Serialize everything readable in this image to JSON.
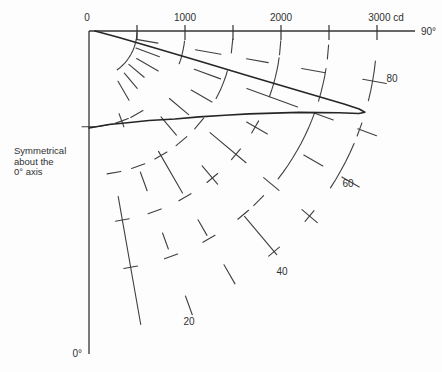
{
  "diagram": {
    "kind": "polar luminous intensity distribution",
    "background": "#fdfdfd",
    "grid_color": "#3f3f3f",
    "axis_color": "#343434",
    "curve_color": "#262626",
    "text_color": "#303030"
  },
  "annotation": {
    "lines": [
      "Symmetrical",
      "about the",
      "0° axis"
    ]
  },
  "cd_axis": {
    "labels": [
      {
        "text": "0",
        "cd": 0,
        "dx": -2
      },
      {
        "text": "1000",
        "cd": 1000,
        "dx": 0
      },
      {
        "text": "2000",
        "cd": 2000,
        "dx": 0
      },
      {
        "text": "3000 cd",
        "cd": 3000,
        "dx": 9
      }
    ],
    "tick_cds": [
      500,
      1000,
      1500,
      2000,
      2500,
      3000
    ],
    "end_label": "90°"
  },
  "nadir_axis": {
    "label": "0°"
  },
  "angle_ring_labels": [
    {
      "text": "80",
      "x": 392,
      "y": 82
    },
    {
      "text": "60",
      "x": 348,
      "y": 187
    },
    {
      "text": "40",
      "x": 282,
      "y": 275
    },
    {
      "text": "20",
      "x": 189,
      "y": 325
    }
  ],
  "chart_data": {
    "type": "line",
    "coordinate_system": "polar",
    "title": "",
    "value_unit": "cd",
    "angle_unit": "degrees from 0° (nadir) axis",
    "cd_range": [
      0,
      3000
    ],
    "angle_deg_range": [
      0,
      90
    ],
    "origin_px": [
      89,
      31
    ],
    "px_per_cd": 0.096,
    "axis_end_x_px": 415,
    "nadir_end_y_px": 354,
    "ray_angles_deg": [
      10,
      20,
      30,
      40,
      50,
      60,
      70,
      80
    ],
    "arc_radii_cd": [
      500,
      1000,
      1500,
      2000,
      2500,
      3000
    ],
    "curve_points": [
      {
        "angle_deg": 90.0,
        "cd": 62
      },
      {
        "angle_deg": 78.0,
        "cd": 320
      },
      {
        "angle_deg": 75.7,
        "cd": 645
      },
      {
        "angle_deg": 74.7,
        "cd": 1188
      },
      {
        "angle_deg": 74.3,
        "cd": 1730
      },
      {
        "angle_deg": 74.1,
        "cd": 2273
      },
      {
        "angle_deg": 74.0,
        "cd": 2763
      },
      {
        "angle_deg": 73.9,
        "cd": 2930
      },
      {
        "angle_deg": 73.6,
        "cd": 2996
      },
      {
        "angle_deg": 73.0,
        "cd": 2940
      },
      {
        "angle_deg": 71.9,
        "cd": 2738
      },
      {
        "angle_deg": 68.8,
        "cd": 2346
      },
      {
        "angle_deg": 62.6,
        "cd": 1877
      },
      {
        "angle_deg": 58.2,
        "cd": 1667
      },
      {
        "angle_deg": 52.0,
        "cd": 1454
      },
      {
        "angle_deg": 44.3,
        "cd": 1281
      },
      {
        "angle_deg": 33.8,
        "cd": 1122
      },
      {
        "angle_deg": 21.4,
        "cd": 1029
      },
      {
        "angle_deg": 12.1,
        "cd": 996
      },
      {
        "angle_deg": 0.0,
        "cd": 1010
      }
    ],
    "grid_style": {
      "ray_dash_segments_px": {
        "10": [
          [
            168,
            298
          ]
        ],
        "20": [
          [
            88,
            102
          ],
          [
            150,
            170
          ],
          [
            215,
            232
          ],
          [
            282,
            302
          ]
        ],
        "30": [
          [
            58,
            80
          ],
          [
            139,
            187
          ],
          [
            218,
            236
          ],
          [
            270,
            292
          ]
        ],
        "40": [
          [
            55,
            75
          ],
          [
            112,
            136
          ],
          [
            176,
            200
          ],
          [
            242,
            292
          ]
        ],
        "50": [
          [
            52,
            72
          ],
          [
            105,
            130
          ],
          [
            158,
            205
          ],
          [
            228,
            248
          ],
          [
            278,
            298
          ]
        ],
        "60": [
          [
            55,
            80
          ],
          [
            118,
            142
          ],
          [
            182,
            206
          ],
          [
            248,
            270
          ],
          [
            292,
            312
          ]
        ],
        "70": [
          [
            50,
            75
          ],
          [
            112,
            140
          ],
          [
            168,
            222
          ],
          [
            238,
            260
          ],
          [
            286,
            306
          ]
        ],
        "80": [
          [
            48,
            70
          ],
          [
            108,
            134
          ],
          [
            160,
            182
          ],
          [
            216,
            240
          ],
          [
            278,
            302
          ]
        ]
      },
      "arc_pieces": [
        {
          "r_px": 48,
          "a0": 36,
          "a1": 88
        },
        {
          "r_px": 96,
          "a0": 70,
          "a1": 85
        },
        {
          "r_px": 144,
          "a0": 62,
          "a1": 74
        },
        {
          "r_px": 192,
          "a0": 70,
          "a1": 82
        },
        {
          "r_px": 240,
          "a0": 52,
          "a1": 70
        },
        {
          "r_px": 240,
          "a0": 73,
          "a1": 82
        },
        {
          "r_px": 288,
          "a0": 57,
          "a1": 67
        },
        {
          "r_px": 288,
          "a0": 76,
          "a1": 85
        }
      ],
      "arc_ticks": [
        {
          "r_px": 96,
          "angles": [
            0,
            10,
            20,
            30
          ]
        },
        {
          "r_px": 144,
          "angles": [
            10,
            20,
            30,
            40,
            50,
            84
          ]
        },
        {
          "r_px": 192,
          "angles": [
            10,
            20,
            30,
            40,
            50,
            60,
            85
          ]
        },
        {
          "r_px": 240,
          "angles": [
            10,
            20,
            30,
            40,
            45,
            85
          ]
        },
        {
          "r_px": 288,
          "angles": [
            40,
            50,
            70
          ]
        }
      ],
      "tick_len_px": 14
    }
  }
}
